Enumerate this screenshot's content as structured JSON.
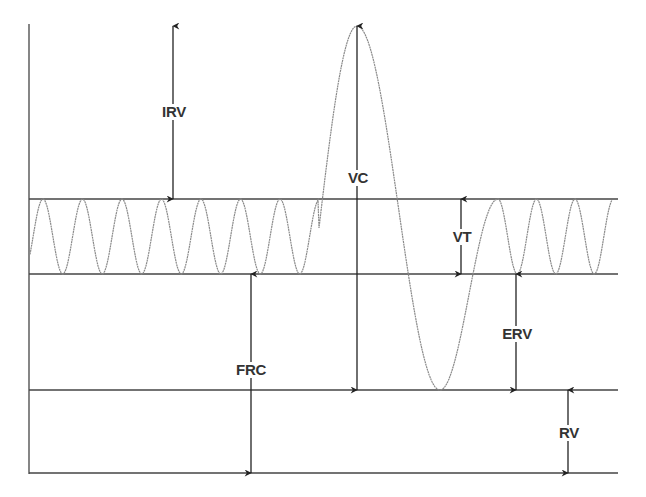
{
  "diagram": {
    "title": "",
    "type": "lung-volumes-spirogram",
    "colors": {
      "background": "#ffffff",
      "lines": "#444444",
      "wave": "#8a8a8a",
      "arrows": "#222222",
      "text": "#333333"
    },
    "levels": [
      {
        "id": "tidal-top",
        "y": 199
      },
      {
        "id": "frc-level",
        "y": 274
      },
      {
        "id": "rv-level",
        "y": 390
      },
      {
        "id": "baseline",
        "y": 473
      }
    ],
    "labels": {
      "irv": "IRV",
      "vc": "VC",
      "vt": "VT",
      "frc": "FRC",
      "erv": "ERV",
      "rv": "RV"
    },
    "annotations": [
      {
        "key": "irv",
        "text": "IRV",
        "meaning": "Inspiratory reserve volume",
        "x": 173,
        "y_from": 26,
        "y_to": 199,
        "label_y": 112
      },
      {
        "key": "vc",
        "text": "VC",
        "meaning": "Vital capacity",
        "x": 357,
        "y_from": 26,
        "y_to": 390,
        "label_y": 178
      },
      {
        "key": "vt",
        "text": "VT",
        "meaning": "Tidal volume",
        "x": 461,
        "y_from": 199,
        "y_to": 274,
        "label_y": 237
      },
      {
        "key": "frc",
        "text": "FRC",
        "meaning": "Functional residual capacity",
        "x": 251,
        "y_from": 274,
        "y_to": 473,
        "label_y": 370
      },
      {
        "key": "erv",
        "text": "ERV",
        "meaning": "Expiratory reserve volume",
        "x": 516,
        "y_from": 274,
        "y_to": 390,
        "label_y": 334
      },
      {
        "key": "rv",
        "text": "RV",
        "meaning": "Residual volume",
        "x": 568,
        "y_from": 390,
        "y_to": 473,
        "label_y": 433
      }
    ]
  }
}
